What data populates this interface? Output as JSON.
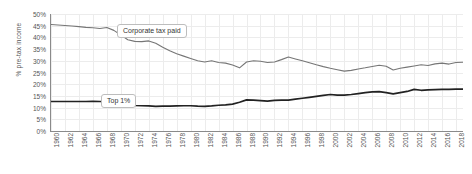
{
  "chart_data": {
    "type": "line",
    "title": "",
    "xlabel": "",
    "ylabel": "% pre-tax income",
    "ylim": [
      0,
      50
    ],
    "xlim": [
      1960,
      2019
    ],
    "grid": true,
    "legend_position": "inline-annotations",
    "ytick_labels": [
      "50%",
      "45%",
      "40%",
      "35%",
      "30%",
      "25%",
      "20%",
      "15%",
      "10%",
      "5%",
      "0%"
    ],
    "ytick_values": [
      50,
      45,
      40,
      35,
      30,
      25,
      20,
      15,
      10,
      5,
      0
    ],
    "xtick_labels": [
      "1960",
      "1962",
      "1964",
      "1966",
      "1968",
      "1970",
      "1972",
      "1974",
      "1976",
      "1978",
      "1980",
      "1982",
      "1984",
      "1986",
      "1988",
      "1990",
      "1992",
      "1994",
      "1996",
      "1998",
      "2000",
      "2002",
      "2004",
      "2006",
      "2008",
      "2010",
      "2012",
      "2014",
      "2016",
      "2018"
    ],
    "xtick_values": [
      1960,
      1962,
      1964,
      1966,
      1968,
      1970,
      1972,
      1974,
      1976,
      1978,
      1980,
      1982,
      1984,
      1986,
      1988,
      1990,
      1992,
      1994,
      1996,
      1998,
      2000,
      2002,
      2004,
      2006,
      2008,
      2010,
      2012,
      2014,
      2016,
      2018
    ],
    "x": [
      1960,
      1961,
      1962,
      1963,
      1964,
      1965,
      1966,
      1967,
      1968,
      1969,
      1970,
      1971,
      1972,
      1973,
      1974,
      1975,
      1976,
      1977,
      1978,
      1979,
      1980,
      1981,
      1982,
      1983,
      1984,
      1985,
      1986,
      1987,
      1988,
      1989,
      1990,
      1991,
      1992,
      1993,
      1994,
      1995,
      1996,
      1997,
      1998,
      1999,
      2000,
      2001,
      2002,
      2003,
      2004,
      2005,
      2006,
      2007,
      2008,
      2009,
      2010,
      2011,
      2012,
      2013,
      2014,
      2015,
      2016,
      2017,
      2018,
      2019
    ],
    "series": [
      {
        "name": "Corporate tax paid",
        "color": "#767676",
        "annotation": "Corporate tax paid",
        "values": [
          45.5,
          45.3,
          45.1,
          44.9,
          44.6,
          44.3,
          44.1,
          43.8,
          44.2,
          43.0,
          41.0,
          39.0,
          38.3,
          38.2,
          38.5,
          37.5,
          35.8,
          34.3,
          33.0,
          32.0,
          31.0,
          30.0,
          29.5,
          30.0,
          29.3,
          29.0,
          28.2,
          27.0,
          29.5,
          30.0,
          29.8,
          29.3,
          29.5,
          30.5,
          31.6,
          30.8,
          30.0,
          29.2,
          28.3,
          27.5,
          26.8,
          26.2,
          25.6,
          25.9,
          26.5,
          27.0,
          27.6,
          28.1,
          27.7,
          26.1,
          26.8,
          27.3,
          27.8,
          28.3,
          28.0,
          28.7,
          29.0,
          28.6,
          29.3,
          29.4
        ]
      },
      {
        "name": "Top 1%",
        "color": "#222222",
        "annotation": "Top 1%",
        "values": [
          12.6,
          12.6,
          12.6,
          12.6,
          12.6,
          12.6,
          12.7,
          12.6,
          12.5,
          12.3,
          11.8,
          11.2,
          10.9,
          10.8,
          10.7,
          10.5,
          10.6,
          10.6,
          10.7,
          10.8,
          10.8,
          10.6,
          10.5,
          10.7,
          11.0,
          11.2,
          11.5,
          12.3,
          13.3,
          13.2,
          13.0,
          12.8,
          13.1,
          13.2,
          13.2,
          13.6,
          14.0,
          14.4,
          14.8,
          15.2,
          15.6,
          15.3,
          15.3,
          15.6,
          16.0,
          16.4,
          16.7,
          16.8,
          16.4,
          15.9,
          16.4,
          16.9,
          17.8,
          17.4,
          17.6,
          17.7,
          17.8,
          17.8,
          17.9,
          17.9
        ]
      }
    ]
  }
}
